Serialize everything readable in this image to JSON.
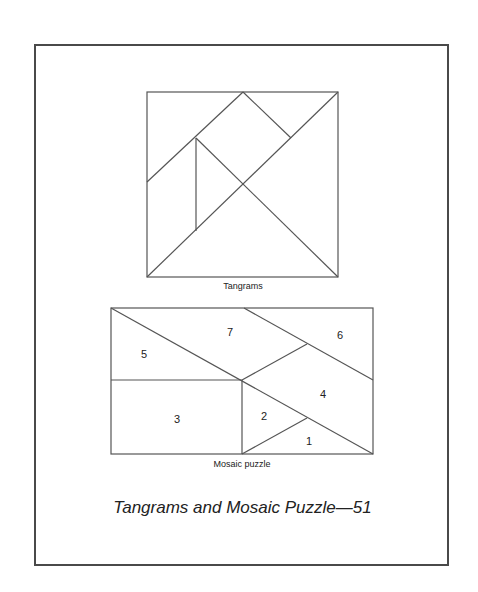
{
  "page": {
    "caption": "Tangrams and Mosaic Puzzle—51"
  },
  "tangram": {
    "label": "Tangrams"
  },
  "mosaic": {
    "label": "Mosaic puzzle",
    "pieces": [
      {
        "number": "1"
      },
      {
        "number": "2"
      },
      {
        "number": "3"
      },
      {
        "number": "4"
      },
      {
        "number": "5"
      },
      {
        "number": "6"
      },
      {
        "number": "7"
      }
    ]
  },
  "colors": {
    "line": "#555555",
    "frame": "#4a4a4a",
    "text": "#222222",
    "background": "#ffffff"
  }
}
